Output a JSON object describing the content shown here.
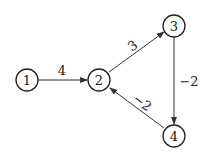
{
  "graph": {
    "nodes": [
      {
        "id": "1",
        "label": "1"
      },
      {
        "id": "2",
        "label": "2"
      },
      {
        "id": "3",
        "label": "3"
      },
      {
        "id": "4",
        "label": "4"
      }
    ],
    "edges": [
      {
        "from": "1",
        "to": "2",
        "weight": "4"
      },
      {
        "from": "2",
        "to": "3",
        "weight": "3"
      },
      {
        "from": "3",
        "to": "4",
        "weight": "−2"
      },
      {
        "from": "4",
        "to": "2",
        "weight": "−2"
      }
    ]
  }
}
